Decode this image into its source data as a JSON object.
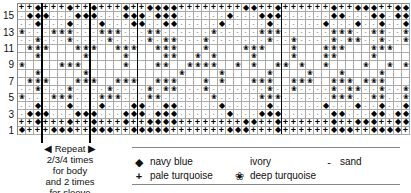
{
  "chart": {
    "row_labels": [
      "15",
      "13",
      "11",
      "9",
      "7",
      "5",
      "3",
      "1"
    ],
    "columns": 49,
    "rows_top_to_bottom": [
      "PPNPPPNPPNPPPNPPNNNNPPPPPPPPNNPPNPPPPPPNPPNNNPPNN",
      "SNNNSSSNNNSSSNNNSNNNSSSSSSNSSSNNNSSSSSSNNSSSNNSNN",
      "SSNSSSNSSSNSSSNNSSNNSSSSSNSSSSSNSSSSSSNSSSNSSNSSN",
      "DSSSDDDSSSDDDSSSDDSSSSSSDSSSSSDDDSSSSSSDDDSSDDSSD",
      "SSDSSSDSSSSDSSSSDSDDSSSDSSSSSSSDSSDSSSSDSDDSSDSSD",
      ".DDD...DDD..DDD..DDD...D....DDD...D...DDD...DDD..",
      "..D.....D....D....DD..D.D....D....D...DD....D....",
      "D....DDD.....D...DD..DDDD..D.D..DD.D..D....D..D.D",
      "..D.....D...........D....D.....D....D...D....D...",
      ".DDD...DDD..DDD..DDD...D.D...DDD..DDD..DDD.DDD..",
      "SSDSSSDSSSSDSSSSDSDDSSSDSSSSSSSDSSDSSSSDSDDSSDSSD",
      "DSSSDDDSSSDDDSSSDDSSSSSSDSSSSSDDDSSSSSSDDDSSDDSSD",
      "SSNSSSNSSSNSSSNNSSNNSSSSSNSSSSSNSSSSSSNSSSNSSNSSN",
      "SNNNSSSNNNSSSNNNSNNNSSSSSSNSSSNNNSSSSSSNNSSSNNSNN",
      "PPNPPPNPPNPPPNPPNNNNPPPPPPPPNNPPNPPPPPPNPPNNNPPNN",
      "NPPPNNNPPNNNPPNNNNNPPPPPPPNNNPPPNPPPPPPNNNPPNNNNP"
    ],
    "repeat_note": "Repeat 2/3/4 times for body and 2 times for sleeve"
  },
  "repeat": {
    "line1": "◀ Repeat ▶",
    "line2": "2/3/4 times",
    "line3": "for body",
    "line4": "and 2 times",
    "line5": "for sleeve"
  },
  "legend": {
    "navy": {
      "symbol": "◆",
      "label": "navy blue"
    },
    "ivory": {
      "symbol": "",
      "label": "ivory"
    },
    "sand": {
      "symbol": "-",
      "label": "sand"
    },
    "pale": {
      "symbol": "+",
      "label": "pale turquoise"
    },
    "deep": {
      "symbol": "❀",
      "label": "deep turquoise"
    }
  }
}
